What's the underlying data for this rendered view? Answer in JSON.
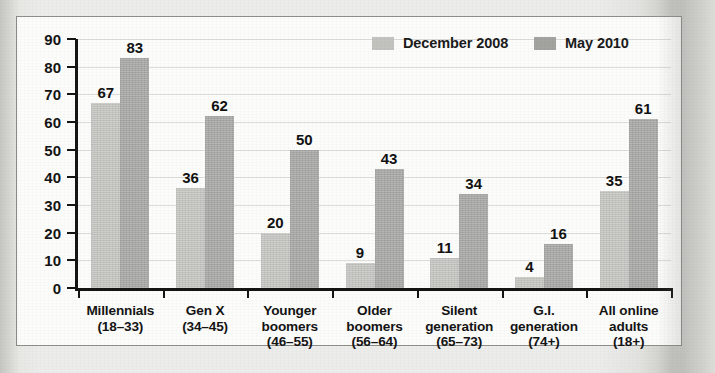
{
  "chart_data": {
    "type": "bar",
    "title": "",
    "xlabel": "",
    "ylabel": "",
    "ylim": [
      0,
      90
    ],
    "ytick_step": 10,
    "yticks": [
      90,
      80,
      70,
      60,
      50,
      40,
      30,
      20,
      10,
      0
    ],
    "grid": true,
    "legend_position": "top-right",
    "categories": [
      "Millennials\n(18–33)",
      "Gen X\n(34–45)",
      "Younger\nboomers\n(46–55)",
      "Older\nboomers\n(56–64)",
      "Silent\ngeneration\n(65–73)",
      "G.I.\ngeneration\n(74+)",
      "All online\nadults\n(18+)"
    ],
    "series": [
      {
        "name": "December 2008",
        "color": "#c2c2bf",
        "values": [
          67,
          36,
          20,
          9,
          11,
          4,
          35
        ]
      },
      {
        "name": "May 2010",
        "color": "#a3a3a0",
        "values": [
          83,
          62,
          50,
          43,
          34,
          16,
          61
        ]
      }
    ]
  },
  "legend": {
    "items": [
      {
        "label": "December 2008",
        "swatch": "#c2c2bf"
      },
      {
        "label": "May 2010",
        "swatch": "#a3a3a0"
      }
    ]
  },
  "axis": {
    "y_ticks": [
      "90",
      "80",
      "70",
      "60",
      "50",
      "40",
      "30",
      "20",
      "10",
      "0"
    ]
  },
  "categories": [
    {
      "lines": [
        "Millennials",
        "(18–33)"
      ]
    },
    {
      "lines": [
        "Gen X",
        "(34–45)"
      ]
    },
    {
      "lines": [
        "Younger",
        "boomers",
        "(46–55)"
      ]
    },
    {
      "lines": [
        "Older",
        "boomers",
        "(56–64)"
      ]
    },
    {
      "lines": [
        "Silent",
        "generation",
        "(65–73)"
      ]
    },
    {
      "lines": [
        "G.I.",
        "generation",
        "(74+)"
      ]
    },
    {
      "lines": [
        "All online",
        "adults",
        "(18+)"
      ]
    }
  ],
  "colors": {
    "series_a": "#c2c2bf",
    "series_b": "#a3a3a0",
    "axis": "#151515",
    "gridline": "#dcdcd8",
    "card_bg": "#fcfcfb",
    "card_border": "#8d8d8a",
    "page_bg": "#ececeb"
  }
}
